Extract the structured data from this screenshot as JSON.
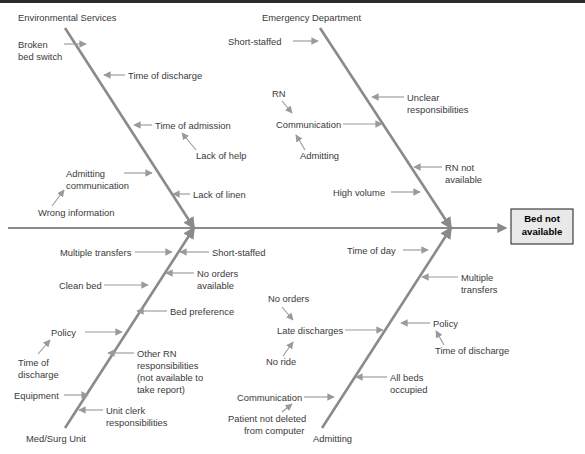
{
  "diagram": {
    "type": "fishbone-ishikawa-cause-and-effect",
    "effect": {
      "line1": "Bed not",
      "line2": "available"
    },
    "colors": {
      "bone": "#8a8a8a",
      "spine": "#8a8a8a",
      "connector": "#9a9a9a",
      "text": "#3a3a3a",
      "effect_box_fill": "#e9e9e9",
      "effect_box_stroke": "#2f2f2f",
      "background": "#ffffff"
    },
    "categories": [
      {
        "id": "environmental-services",
        "label": "Environmental Services",
        "position": "top-left"
      },
      {
        "id": "emergency-department",
        "label": "Emergency Department",
        "position": "top-right"
      },
      {
        "id": "med-surg-unit",
        "label": "Med/Surg Unit",
        "position": "bottom-left"
      },
      {
        "id": "admitting",
        "label": "Admitting",
        "position": "bottom-right"
      }
    ],
    "causes": {
      "environmental_services": [
        {
          "text": "Broken",
          "text2": "bed switch"
        },
        {
          "text": "Time of discharge"
        },
        {
          "text": "Time of admission"
        },
        {
          "text": "Lack of help"
        },
        {
          "text": "Admitting",
          "text2": "communication"
        },
        {
          "text": "Wrong information"
        },
        {
          "text": "Lack of linen"
        }
      ],
      "emergency_department": [
        {
          "text": "Short-staffed"
        },
        {
          "text": "RN"
        },
        {
          "text": "Communication"
        },
        {
          "text": "Admitting"
        },
        {
          "text": "Unclear",
          "text2": "responsibilities"
        },
        {
          "text": "RN not",
          "text2": "available"
        },
        {
          "text": "High volume"
        }
      ],
      "med_surg_unit": [
        {
          "text": "Multiple transfers"
        },
        {
          "text": "Short-staffed"
        },
        {
          "text": "Clean bed"
        },
        {
          "text": "No orders",
          "text2": "available"
        },
        {
          "text": "Bed preference"
        },
        {
          "text": "Policy"
        },
        {
          "text": "Time of",
          "text2": "discharge"
        },
        {
          "text": "Other RN",
          "text2": "responsibilities",
          "text3": "(not available to",
          "text4": "take report)"
        },
        {
          "text": "Equipment"
        },
        {
          "text": "Unit clerk",
          "text2": "responsibilities"
        }
      ],
      "admitting": [
        {
          "text": "Time of day"
        },
        {
          "text": "Multiple",
          "text2": "transfers"
        },
        {
          "text": "No orders"
        },
        {
          "text": "Late discharges"
        },
        {
          "text": "No ride"
        },
        {
          "text": "Policy"
        },
        {
          "text": "Time of discharge"
        },
        {
          "text": "All beds",
          "text2": "occupied"
        },
        {
          "text": "Communication"
        },
        {
          "text": "Patient not deleted",
          "text2": "from computer"
        }
      ]
    }
  }
}
